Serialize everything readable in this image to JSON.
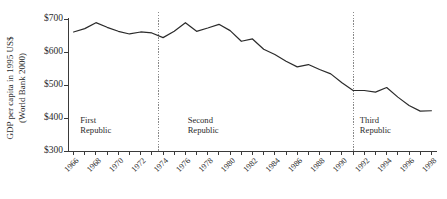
{
  "chart_data": {
    "type": "line",
    "title": "",
    "subtitle": "",
    "xlabel": "",
    "ylabel": "GDP per capita in 1995 US$",
    "ylabel_line2": "(World Bank 2000)",
    "xlim": [
      1965.5,
      1998.5
    ],
    "ylim": [
      300,
      700
    ],
    "grid": false,
    "legend": "none",
    "ytick_labels": [
      "$700",
      "$600",
      "$500",
      "$400",
      "$300"
    ],
    "ytick_values": [
      700,
      600,
      500,
      400,
      300
    ],
    "xtick_labels": [
      "1966",
      "1968",
      "1970",
      "1972",
      "1974",
      "1976",
      "1978",
      "1980",
      "1982",
      "1984",
      "1986",
      "1988",
      "1990",
      "1992",
      "1994",
      "1996",
      "1998"
    ],
    "xtick_values": [
      1966,
      1968,
      1970,
      1972,
      1974,
      1976,
      1978,
      1980,
      1982,
      1984,
      1986,
      1988,
      1990,
      1992,
      1994,
      1996,
      1998
    ],
    "x": [
      1966,
      1967,
      1968,
      1969,
      1970,
      1971,
      1972,
      1973,
      1974,
      1975,
      1976,
      1977,
      1978,
      1979,
      1980,
      1981,
      1982,
      1983,
      1984,
      1985,
      1986,
      1987,
      1988,
      1989,
      1990,
      1991,
      1992,
      1993,
      1994,
      1995,
      1996,
      1997,
      1998
    ],
    "values": [
      658,
      668,
      686,
      672,
      660,
      652,
      658,
      655,
      641,
      660,
      686,
      660,
      670,
      681,
      662,
      630,
      637,
      606,
      590,
      570,
      553,
      560,
      545,
      532,
      505,
      482,
      482,
      477,
      491,
      462,
      437,
      420,
      421
    ],
    "series": [
      {
        "name": "GDP per capita",
        "color": "#2b2b2b",
        "values": [
          658,
          668,
          686,
          672,
          660,
          652,
          658,
          655,
          641,
          660,
          686,
          660,
          670,
          681,
          662,
          630,
          637,
          606,
          590,
          570,
          553,
          560,
          545,
          532,
          505,
          482,
          482,
          477,
          491,
          462,
          437,
          420,
          421
        ]
      }
    ],
    "annotations": [
      {
        "label_line1": "First",
        "label_line2": "Republic",
        "x": 1966.6,
        "y": 385
      },
      {
        "label_line1": "Second",
        "label_line2": "Republic",
        "x": 1976.2,
        "y": 385
      },
      {
        "label_line1": "Third",
        "label_line2": "Republic",
        "x": 1991.6,
        "y": 385
      }
    ],
    "dividers": [
      {
        "x": 1973.6,
        "style": "dotted",
        "color": "#8a8a8a"
      },
      {
        "x": 1991.0,
        "style": "dotted",
        "color": "#8a8a8a"
      }
    ]
  }
}
